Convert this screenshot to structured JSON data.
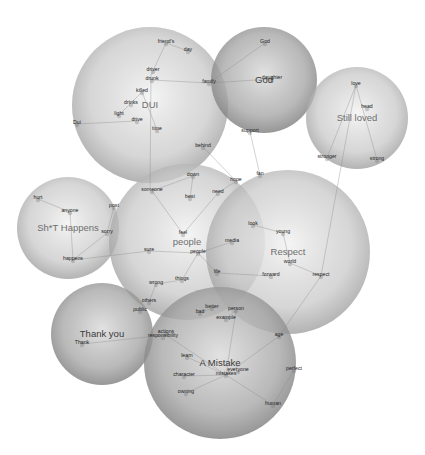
{
  "diagram": {
    "type": "bubble-word-network",
    "clusters": [
      {
        "id": "dui",
        "label": "DUI",
        "cx": 150,
        "cy": 105,
        "r": 78,
        "tone": "light",
        "label_dark": false
      },
      {
        "id": "god",
        "label": "God",
        "cx": 264,
        "cy": 80,
        "r": 53,
        "tone": "dark",
        "label_dark": true
      },
      {
        "id": "still_loved",
        "label": "Still loved",
        "cx": 357,
        "cy": 118,
        "r": 51,
        "tone": "light",
        "label_dark": false
      },
      {
        "id": "shit_happens",
        "label": "Sh*T Happens",
        "cx": 68,
        "cy": 228,
        "r": 51,
        "tone": "light",
        "label_dark": false
      },
      {
        "id": "people",
        "label": "people",
        "cx": 187,
        "cy": 242,
        "r": 78,
        "tone": "light",
        "label_dark": false
      },
      {
        "id": "respect",
        "label": "Respect",
        "cx": 288,
        "cy": 252,
        "r": 82,
        "tone": "light",
        "label_dark": false
      },
      {
        "id": "thank_you",
        "label": "Thank you",
        "cx": 102,
        "cy": 334,
        "r": 51,
        "tone": "dark",
        "label_dark": true
      },
      {
        "id": "a_mistake",
        "label": "A Mistake",
        "cx": 220,
        "cy": 363,
        "r": 76,
        "tone": "dark",
        "label_dark": true
      }
    ],
    "words": [
      {
        "text": "friend's",
        "x": 166,
        "y": 43
      },
      {
        "text": "day",
        "x": 188,
        "y": 51
      },
      {
        "text": "driver",
        "x": 153,
        "y": 71
      },
      {
        "text": "drunk",
        "x": 152,
        "y": 80
      },
      {
        "text": "family",
        "x": 209,
        "y": 83
      },
      {
        "text": "killed",
        "x": 142,
        "y": 92
      },
      {
        "text": "drinks",
        "x": 131,
        "y": 104
      },
      {
        "text": "light",
        "x": 119,
        "y": 115
      },
      {
        "text": "drive",
        "x": 137,
        "y": 121
      },
      {
        "text": "Dui",
        "x": 77,
        "y": 124
      },
      {
        "text": "time",
        "x": 157,
        "y": 130
      },
      {
        "text": "behind",
        "x": 203,
        "y": 147
      },
      {
        "text": "God",
        "x": 265,
        "y": 43
      },
      {
        "text": "daughter",
        "x": 272,
        "y": 79
      },
      {
        "text": "support",
        "x": 250,
        "y": 132
      },
      {
        "text": "love",
        "x": 356,
        "y": 85
      },
      {
        "text": "head",
        "x": 367,
        "y": 108
      },
      {
        "text": "stronger",
        "x": 327,
        "y": 158
      },
      {
        "text": "strong",
        "x": 377,
        "y": 160
      },
      {
        "text": "hope",
        "x": 236,
        "y": 181
      },
      {
        "text": "fan",
        "x": 260,
        "y": 175
      },
      {
        "text": "down",
        "x": 193,
        "y": 176
      },
      {
        "text": "someone",
        "x": 152,
        "y": 191
      },
      {
        "text": "best",
        "x": 190,
        "y": 198
      },
      {
        "text": "need",
        "x": 218,
        "y": 193
      },
      {
        "text": "hurt",
        "x": 38,
        "y": 199
      },
      {
        "text": "anyone",
        "x": 70,
        "y": 212
      },
      {
        "text": "post",
        "x": 114,
        "y": 207
      },
      {
        "text": "sorry",
        "x": 107,
        "y": 233
      },
      {
        "text": "happens",
        "x": 73,
        "y": 260
      },
      {
        "text": "feel",
        "x": 183,
        "y": 234
      },
      {
        "text": "media",
        "x": 232,
        "y": 242
      },
      {
        "text": "look",
        "x": 253,
        "y": 225
      },
      {
        "text": "young",
        "x": 283,
        "y": 233
      },
      {
        "text": "sure",
        "x": 149,
        "y": 251
      },
      {
        "text": "people",
        "x": 198,
        "y": 253
      },
      {
        "text": "world",
        "x": 290,
        "y": 263
      },
      {
        "text": "life",
        "x": 217,
        "y": 273
      },
      {
        "text": "forward",
        "x": 271,
        "y": 276
      },
      {
        "text": "respect",
        "x": 321,
        "y": 276
      },
      {
        "text": "things",
        "x": 182,
        "y": 280
      },
      {
        "text": "wrong",
        "x": 156,
        "y": 284
      },
      {
        "text": "others",
        "x": 149,
        "y": 302
      },
      {
        "text": "public",
        "x": 140,
        "y": 311
      },
      {
        "text": "better",
        "x": 212,
        "y": 308
      },
      {
        "text": "bad",
        "x": 200,
        "y": 313
      },
      {
        "text": "person",
        "x": 236,
        "y": 310
      },
      {
        "text": "example",
        "x": 226,
        "y": 319
      },
      {
        "text": "Thank you",
        "x": 102,
        "y": 333
      },
      {
        "text": "Thank",
        "x": 82,
        "y": 344
      },
      {
        "text": "actions",
        "x": 166,
        "y": 333
      },
      {
        "text": "responsibility",
        "x": 163,
        "y": 337
      },
      {
        "text": "age",
        "x": 279,
        "y": 336
      },
      {
        "text": "learn",
        "x": 187,
        "y": 357
      },
      {
        "text": "everyone",
        "x": 238,
        "y": 371
      },
      {
        "text": "mistakes",
        "x": 226,
        "y": 375
      },
      {
        "text": "character",
        "x": 184,
        "y": 376
      },
      {
        "text": "perfect",
        "x": 294,
        "y": 370
      },
      {
        "text": "owning",
        "x": 186,
        "y": 393
      },
      {
        "text": "human",
        "x": 273,
        "y": 405
      }
    ],
    "edges": [
      [
        166,
        43,
        151,
        75
      ],
      [
        188,
        51,
        166,
        43
      ],
      [
        152,
        80,
        209,
        83
      ],
      [
        142,
        92,
        119,
        115
      ],
      [
        137,
        121,
        77,
        124
      ],
      [
        142,
        92,
        157,
        130
      ],
      [
        151,
        75,
        150,
        190
      ],
      [
        209,
        83,
        265,
        43
      ],
      [
        209,
        83,
        272,
        79
      ],
      [
        250,
        132,
        260,
        175
      ],
      [
        203,
        147,
        236,
        181
      ],
      [
        356,
        85,
        327,
        158
      ],
      [
        356,
        85,
        377,
        160
      ],
      [
        356,
        85,
        321,
        276
      ],
      [
        193,
        176,
        190,
        198
      ],
      [
        193,
        176,
        152,
        191
      ],
      [
        152,
        191,
        183,
        234
      ],
      [
        218,
        193,
        183,
        234
      ],
      [
        236,
        181,
        218,
        193
      ],
      [
        38,
        199,
        70,
        212
      ],
      [
        70,
        212,
        73,
        260
      ],
      [
        107,
        233,
        73,
        260
      ],
      [
        114,
        207,
        107,
        233
      ],
      [
        73,
        260,
        149,
        251
      ],
      [
        149,
        251,
        198,
        253
      ],
      [
        198,
        253,
        232,
        242
      ],
      [
        198,
        253,
        182,
        280
      ],
      [
        198,
        253,
        217,
        273
      ],
      [
        217,
        273,
        271,
        276
      ],
      [
        253,
        225,
        283,
        233
      ],
      [
        290,
        263,
        321,
        276
      ],
      [
        283,
        233,
        290,
        263
      ],
      [
        182,
        280,
        156,
        284
      ],
      [
        156,
        284,
        149,
        302
      ],
      [
        82,
        344,
        166,
        335
      ],
      [
        166,
        335,
        226,
        375
      ],
      [
        226,
        319,
        236,
        310
      ],
      [
        236,
        310,
        226,
        375
      ],
      [
        187,
        357,
        226,
        375
      ],
      [
        184,
        376,
        226,
        375
      ],
      [
        186,
        393,
        226,
        375
      ],
      [
        226,
        375,
        273,
        405
      ],
      [
        226,
        375,
        279,
        336
      ],
      [
        279,
        336,
        321,
        276
      ],
      [
        294,
        370,
        273,
        405
      ],
      [
        200,
        313,
        212,
        308
      ]
    ]
  }
}
